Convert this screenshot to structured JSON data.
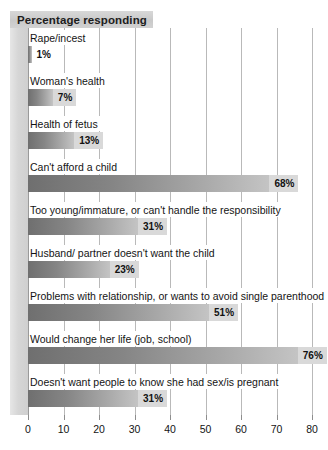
{
  "chart_data": {
    "type": "bar",
    "orientation": "horizontal",
    "title": "Percentage responding",
    "xlabel": "",
    "ylabel": "",
    "xlim": [
      0,
      80
    ],
    "xticks": [
      0,
      10,
      20,
      30,
      40,
      50,
      60,
      70,
      80
    ],
    "xtick_labels": [
      "0",
      "10",
      "20",
      "30",
      "40",
      "50",
      "60",
      "70",
      "80"
    ],
    "grid": true,
    "legend": "none",
    "value_suffix": "%",
    "categories": [
      "Rape/incest",
      "Woman's health",
      "Health of fetus",
      "Can't afford a child",
      "Too young/immature, or can't handle the responsibility",
      "Husband/ partner doesn't want the child",
      "Problems with relationship, or wants to avoid single parenthood",
      "Would change her life (job, school)",
      "Doesn't want people to know she had sex/is pregnant"
    ],
    "values": [
      1,
      7,
      13,
      68,
      31,
      23,
      51,
      76,
      31
    ],
    "value_labels": [
      "1%",
      "7%",
      "13%",
      "68%",
      "31%",
      "23%",
      "51%",
      "76%",
      "31%"
    ],
    "bars": [
      {
        "label": "Rape/incest",
        "value": 1,
        "value_label": "1%",
        "label_outside": true
      },
      {
        "label": "Woman's health",
        "value": 7,
        "value_label": "7%",
        "label_outside": false
      },
      {
        "label": "Health of fetus",
        "value": 13,
        "value_label": "13%",
        "label_outside": false
      },
      {
        "label": "Can't afford a child",
        "value": 68,
        "value_label": "68%",
        "label_outside": false
      },
      {
        "label": "Too young/immature, or can't handle the responsibility",
        "value": 31,
        "value_label": "31%",
        "label_outside": false
      },
      {
        "label": "Husband/ partner doesn't want the child",
        "value": 23,
        "value_label": "23%",
        "label_outside": false
      },
      {
        "label": "Problems with relationship, or wants to avoid single parenthood",
        "value": 51,
        "value_label": "51%",
        "label_outside": false
      },
      {
        "label": "Would change her life (job, school)",
        "value": 76,
        "value_label": "76%",
        "label_outside": false
      },
      {
        "label": "Doesn't want people to know she had sex/is pregnant",
        "value": 31,
        "value_label": "31%",
        "label_outside": false
      }
    ],
    "colors": {
      "bar_gradient_start": "#6f6f6f",
      "bar_gradient_end": "#c4c4c4",
      "value_label_bg": "#d9d9d9",
      "title_band_bg": "#cfcfcf",
      "left_band_bg": "#d6d6d6",
      "gridline": "#b9b9b9",
      "axis": "#8d8d8d",
      "text": "#141414",
      "background": "#ffffff"
    }
  }
}
